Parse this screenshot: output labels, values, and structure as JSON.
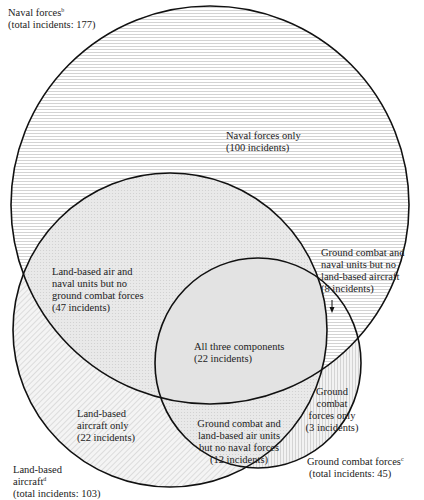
{
  "diagram": {
    "type": "venn",
    "sets": [
      {
        "id": "naval",
        "title": "Naval forces",
        "footnote": "b",
        "total_label": "(total incidents: 177)",
        "total": 177
      },
      {
        "id": "air",
        "title_lines": [
          "Land-based",
          "aircraft"
        ],
        "footnote": "d",
        "total_label": "(total incidents: 103)",
        "total": 103
      },
      {
        "id": "ground",
        "title": "Ground combat forces",
        "footnote": "c",
        "total_label": "(total incidents: 45)",
        "total": 45
      }
    ],
    "regions": {
      "naval_only": {
        "lines": [
          "Naval forces only",
          "(100 incidents)"
        ],
        "count": 100
      },
      "air_naval": {
        "lines": [
          "Land-based air and",
          "naval units but no",
          "ground combat forces",
          "(47 incidents)"
        ],
        "count": 47
      },
      "ground_naval": {
        "lines": [
          "Ground combat and",
          "naval units but no",
          "land-based aircraft",
          "(8 incidents)"
        ],
        "count": 8
      },
      "all_three": {
        "lines": [
          "All three components",
          "(22 incidents)"
        ],
        "count": 22
      },
      "air_only": {
        "lines": [
          "Land-based",
          "aircraft only",
          "(22 incidents)"
        ],
        "count": 22
      },
      "ground_air": {
        "lines": [
          "Ground combat and",
          "land-based air units",
          "but no naval forces",
          "(12 incidents)"
        ],
        "count": 12
      },
      "ground_only": {
        "lines": [
          "Ground",
          "combat",
          "forces only",
          "(3 incidents)"
        ],
        "count": 3
      }
    }
  }
}
